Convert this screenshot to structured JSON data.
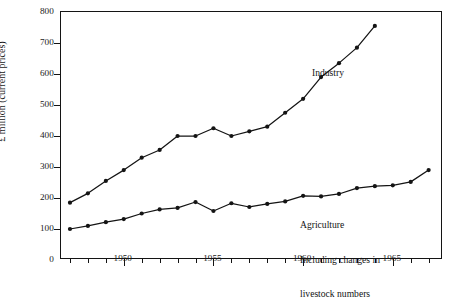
{
  "figure": {
    "y_axis_title": "£ million (current prices)",
    "y_ticks": [
      "0",
      "100",
      "200",
      "300",
      "400",
      "500",
      "600",
      "700",
      "800"
    ],
    "x_ticks": [
      "1950",
      "1955",
      "1960",
      "1965"
    ],
    "annotation_industry": "Industry",
    "annotation_agriculture_line1": "Agriculture",
    "annotation_agriculture_line2": "Including changes in",
    "annotation_agriculture_line3": "livestock numbers",
    "line_color": "#141414",
    "marker_color": "#141414",
    "axis_color": "#141414"
  },
  "chart_data": {
    "type": "line",
    "title": "",
    "xlabel": "",
    "ylabel": "£ million (current prices)",
    "xlim": [
      1946.5,
      1967.8
    ],
    "ylim": [
      0,
      800
    ],
    "yticks": [
      0,
      100,
      200,
      300,
      400,
      500,
      600,
      700,
      800
    ],
    "xticks": [
      1950,
      1955,
      1960,
      1965
    ],
    "xticks_minor": [
      1947,
      1948,
      1949,
      1951,
      1952,
      1953,
      1954,
      1956,
      1957,
      1958,
      1959,
      1961,
      1962,
      1963,
      1964,
      1966,
      1967
    ],
    "grid": false,
    "legend": "inline-annotations",
    "series": [
      {
        "name": "Industry",
        "x": [
          1947,
          1948,
          1949,
          1950,
          1951,
          1952,
          1953,
          1954,
          1955,
          1956,
          1957,
          1958,
          1959,
          1960,
          1961,
          1962,
          1963,
          1964
        ],
        "values": [
          185,
          215,
          255,
          290,
          330,
          355,
          400,
          400,
          425,
          400,
          415,
          430,
          475,
          520,
          590,
          635,
          685,
          755
        ]
      },
      {
        "name": "Agriculture Including changes in livestock numbers",
        "x": [
          1947,
          1948,
          1949,
          1950,
          1951,
          1952,
          1953,
          1954,
          1955,
          1956,
          1957,
          1958,
          1959,
          1960,
          1961,
          1962,
          1963,
          1964,
          1965,
          1966,
          1967
        ],
        "values": [
          100,
          110,
          122,
          132,
          150,
          163,
          168,
          187,
          158,
          183,
          171,
          181,
          189,
          207,
          205,
          213,
          232,
          238,
          241,
          252,
          290
        ]
      }
    ],
    "annotations": [
      {
        "text": "Industry",
        "x": 1960.8,
        "y": 540
      },
      {
        "text": "Agriculture\nIncluding changes in\nlivestock numbers",
        "x": 1959.8,
        "y": 150
      }
    ]
  }
}
